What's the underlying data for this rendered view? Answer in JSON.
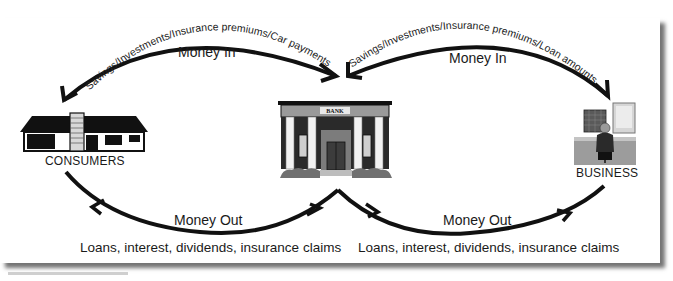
{
  "diagram": {
    "nodes": {
      "consumers": {
        "label": "CONSUMERS",
        "icon": "house-icon"
      },
      "bank": {
        "label": "BANK",
        "icon": "bank-building-icon"
      },
      "business": {
        "label": "BUSINESS",
        "icon": "office-worker-icon"
      }
    },
    "flows": {
      "top_left": {
        "arc_label": "Savings/Investments/Insurance premiums/Car payments",
        "title": "Money In",
        "from": "CONSUMERS",
        "to": "BANK"
      },
      "top_right": {
        "arc_label": "Savings/Investments/Insurance premiums/Loan amounts",
        "title": "Money In",
        "from": "BUSINESS",
        "to": "BANK"
      },
      "bottom_left": {
        "title": "Money Out",
        "caption": "Loans, interest, dividends, insurance claims",
        "from": "BANK",
        "to": "CONSUMERS"
      },
      "bottom_right": {
        "title": "Money Out",
        "caption": "Loans, interest, dividends, insurance claims",
        "from": "BANK",
        "to": "BUSINESS"
      }
    },
    "colors": {
      "ink": "#111111",
      "panel": "#ffffff",
      "shadow": "#7a7a7a",
      "building_gray": "#8a8a8a"
    }
  }
}
